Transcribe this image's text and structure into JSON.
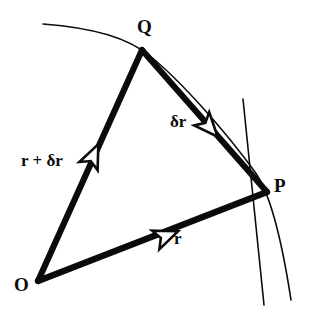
{
  "figure": {
    "type": "vector-geometry-diagram",
    "background_color": "#ffffff",
    "ink_color": "#0b0b0b"
  },
  "points": {
    "origin": {
      "label": "O",
      "x": 38,
      "y": 281
    },
    "q": {
      "label": "Q",
      "x": 142,
      "y": 50
    },
    "p": {
      "label": "P",
      "x": 267,
      "y": 192
    }
  },
  "vectors": [
    {
      "name": "r-plus-delta-r",
      "label": "r + δr",
      "from": "O",
      "to": "Q",
      "arrow_at": {
        "x": 93,
        "y": 156
      },
      "style": "thick-solid-open-arrowhead"
    },
    {
      "name": "delta-r",
      "label": "δr",
      "from": "Q",
      "to": "P",
      "arrow_at": {
        "x": 209,
        "y": 127
      },
      "style": "thick-solid-open-arrowhead"
    },
    {
      "name": "r",
      "label": "r",
      "from": "O",
      "to": "P",
      "arrow_at": {
        "x": 166,
        "y": 236
      },
      "style": "thick-solid-open-arrowhead"
    }
  ],
  "curves": [
    {
      "name": "trajectory-arc",
      "style": "thin-solid",
      "start": {
        "x": 43,
        "y": 24
      },
      "through": [
        {
          "x": 142,
          "y": 50
        },
        {
          "x": 267,
          "y": 192
        }
      ],
      "end": {
        "x": 291,
        "y": 300
      }
    },
    {
      "name": "tangent-line-at-p",
      "style": "thin-solid",
      "start": {
        "x": 243,
        "y": 99
      },
      "end": {
        "x": 264,
        "y": 305
      }
    }
  ],
  "labels": {
    "origin": "O",
    "q_point": "Q",
    "p_point": "P",
    "vector_r": "r",
    "vector_delta_r": "δr",
    "vector_r_plus_delta_r": "r + δr"
  }
}
